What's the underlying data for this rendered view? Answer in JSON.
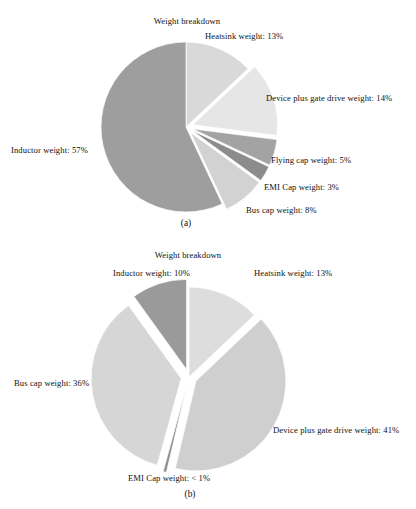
{
  "figure": {
    "background_color": "#ffffff",
    "text_color": "#111111"
  },
  "chart_data": [
    {
      "type": "pie",
      "id": "chart-a",
      "title": "Weight breakdown",
      "caption": "(a)",
      "categories": [
        "Heatsink weight",
        "Device plus gate drive weight",
        "Flying cap weight",
        "EMI Cap weight",
        "Bus cap weight",
        "Inductor weight"
      ],
      "values": [
        13,
        14,
        5,
        3,
        8,
        57
      ],
      "labels": [
        "Heatsink weight: 13%",
        "Device plus gate drive weight: 14%",
        "Flying cap weight: 5%",
        "EMI Cap weight: 3%",
        "Bus cap weight: 8%",
        "Inductor weight: 57%"
      ],
      "colors": [
        "#d9d9d9",
        "#e6e6e6",
        "#a3a3a3",
        "#8c8c8c",
        "#d2d2d2",
        "#9e9e9e"
      ],
      "exploded": [
        false,
        true,
        true,
        true,
        true,
        false
      ],
      "start_angle_deg": 0,
      "direction": "clockwise",
      "legend": "none",
      "grid": false
    },
    {
      "type": "pie",
      "id": "chart-b",
      "title": "Weight breakdown",
      "caption": "(b)",
      "categories": [
        "Heatsink weight",
        "Device plus gate drive weight",
        "EMI Cap weight",
        "Bus cap weight",
        "Inductor weight"
      ],
      "values": [
        13,
        41,
        0.6,
        36,
        10
      ],
      "labels": [
        "Heatsink weight: 13%",
        "Device plus gate drive weight: 41%",
        "EMI Cap weight: < 1%",
        "Bus cap weight: 36%",
        "Inductor weight: 10%"
      ],
      "colors": [
        "#dddddd",
        "#cfcfcf",
        "#8f8f8f",
        "#d6d6d6",
        "#9a9a9a"
      ],
      "exploded": [
        false,
        true,
        true,
        true,
        true
      ],
      "start_angle_deg": 0,
      "direction": "clockwise",
      "legend": "none",
      "grid": false
    }
  ],
  "chart_a": {
    "title": "Weight breakdown",
    "caption": "(a)",
    "label_heatsink": "Heatsink weight: 13%",
    "label_device": "Device plus gate drive weight: 14%",
    "label_flying": "Flying cap weight: 5%",
    "label_emi": "EMI Cap weight: 3%",
    "label_bus": "Bus cap weight: 8%",
    "label_inductor": "Inductor weight: 57%"
  },
  "chart_b": {
    "title": "Weight breakdown",
    "caption": "(b)",
    "label_inductor": "Inductor weight: 10%",
    "label_heatsink": "Heatsink weight: 13%",
    "label_device": "Device plus gate drive weight: 41%",
    "label_bus": "Bus cap weight: 36%",
    "label_emi": "EMI Cap weight: < 1%"
  }
}
